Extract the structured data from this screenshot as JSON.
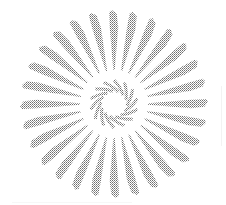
{
  "image": {
    "title": "Radial sunburst rosette ornament",
    "kind": "scanned-halftone-ornament",
    "width": 226,
    "height": 205,
    "background_color": "#ffffff"
  },
  "chart_data": {
    "type": "pie",
    "subtitle": "Halftone-dithered scanned ornament",
    "xlabel": "",
    "ylabel": "",
    "center": {
      "x": 114,
      "y": 104
    },
    "rings": [
      {
        "name": "outer-petal-ring",
        "count": 28,
        "shape": "tapered-spike",
        "inner_radius": 34,
        "outer_radius": 94,
        "tip_half_width": 5.0,
        "base_half_width": 0.7,
        "start_angle_deg": -90,
        "fill_color": "#8c8c8c",
        "notch": true
      },
      {
        "name": "inner-hook-ring",
        "count": 14,
        "shape": "comma-hook",
        "inner_radius": 11,
        "outer_radius": 24,
        "stroke_width": 3.1,
        "start_angle_deg": -90,
        "sweep_deg": 46,
        "fill_color": "#8f8f8f"
      }
    ],
    "core": {
      "name": "white-core",
      "radius": 10,
      "fill_color": "#ffffff"
    },
    "palette": {
      "ink": "#8c8c8c",
      "ink_dark": "#6f6f6f",
      "ink_light": "#b4b4b4",
      "paper": "#ffffff"
    },
    "grid": false,
    "legend": false
  }
}
